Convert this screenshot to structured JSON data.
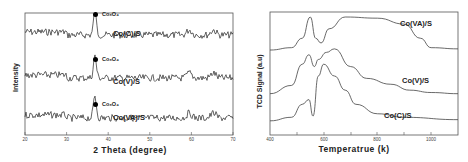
{
  "chart_data": [
    {
      "type": "line",
      "title": "",
      "xlabel": "2 Theta  (degree)",
      "ylabel": "Intensity",
      "xlim": [
        20,
        70
      ],
      "xticks": [
        "20",
        "30",
        "40",
        "50",
        "60",
        "70"
      ],
      "grid": false,
      "legend": "inline labels",
      "annotations": [
        {
          "text": "Co3O4",
          "x": 36.8,
          "series": "Co(C)/S"
        },
        {
          "text": "Co3O4",
          "x": 36.8,
          "series": "Co(V)/S"
        },
        {
          "text": "Co3O4",
          "x": 36.8,
          "series": "Co(VA)/S"
        }
      ],
      "series": [
        {
          "name": "Co(C)/S",
          "peaks": [
            36.8,
            59.5,
            65.3
          ],
          "offset": "top"
        },
        {
          "name": "Co(V)/S",
          "peaks": [
            36.8,
            59.5,
            65.3
          ],
          "offset": "middle"
        },
        {
          "name": "Co(VA)/S",
          "peaks": [
            36.8,
            59.5,
            65.3
          ],
          "offset": "bottom"
        }
      ]
    },
    {
      "type": "line",
      "title": "",
      "xlabel": "Temperatrue (k)",
      "ylabel": "TCD Signal (a.u)",
      "xlim": [
        400,
        1100
      ],
      "xticks": [
        "400",
        "600",
        "800",
        "1000"
      ],
      "grid": false,
      "legend": "inline labels",
      "series": [
        {
          "name": "Co(VA)/S",
          "x": [
            400,
            480,
            520,
            550,
            570,
            590,
            620,
            680,
            800,
            900,
            960,
            1000,
            1100
          ],
          "y": [
            0.72,
            0.74,
            0.82,
            1.0,
            0.82,
            0.78,
            0.9,
            1.0,
            0.99,
            0.94,
            0.82,
            0.74,
            0.73
          ]
        },
        {
          "name": "Co(V)/S",
          "x": [
            400,
            480,
            520,
            545,
            565,
            580,
            610,
            640,
            700,
            760,
            850,
            920,
            1000,
            1100
          ],
          "y": [
            0.35,
            0.42,
            0.6,
            0.68,
            0.58,
            0.64,
            0.7,
            0.73,
            0.58,
            0.48,
            0.43,
            0.38,
            0.36,
            0.35
          ]
        },
        {
          "name": "Co(C)/S",
          "x": [
            400,
            480,
            520,
            545,
            560,
            580,
            600,
            640,
            680,
            720,
            800,
            900,
            1100
          ],
          "y": [
            0.12,
            0.15,
            0.26,
            0.3,
            0.16,
            0.5,
            0.6,
            0.5,
            0.38,
            0.26,
            0.18,
            0.15,
            0.13
          ]
        }
      ]
    }
  ],
  "left": {
    "ylabel": "Intensity",
    "xlabel": "2 Theta  (degree)",
    "xticks": [
      "20",
      "30",
      "40",
      "50",
      "60",
      "70"
    ],
    "labels": [
      "Co(C)/S",
      "Co(V)/S",
      "Co(VA)/S"
    ],
    "peak_label": "Co₃O₄"
  },
  "right": {
    "ylabel": "TCD Signal (a.u)",
    "xlabel": "Temperatrue (k)",
    "xticks": [
      "400",
      "600",
      "800",
      "1000"
    ],
    "labels": [
      "Co(VA)/S",
      "Co(V)/S",
      "Co(C)/S"
    ]
  }
}
